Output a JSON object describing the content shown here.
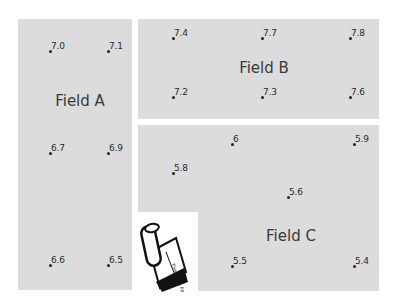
{
  "fields": [
    {
      "id": "A",
      "label": "Field A",
      "rect": [
        18,
        19,
        114,
        271
      ],
      "label_pos": [
        80,
        101
      ],
      "points": [
        {
          "value": "7.0",
          "x": 50,
          "y": 51
        },
        {
          "value": "7.1",
          "x": 108,
          "y": 51
        },
        {
          "value": "6.7",
          "x": 50,
          "y": 153
        },
        {
          "value": "6.9",
          "x": 108,
          "y": 153
        },
        {
          "value": "6.6",
          "x": 50,
          "y": 265
        },
        {
          "value": "6.5",
          "x": 108,
          "y": 265
        }
      ]
    },
    {
      "id": "B",
      "label": "Field B",
      "rect": [
        138,
        19,
        241,
        100
      ],
      "label_pos": [
        264,
        68
      ],
      "points": [
        {
          "value": "7.4",
          "x": 173,
          "y": 38
        },
        {
          "value": "7.7",
          "x": 262,
          "y": 38
        },
        {
          "value": "7.8",
          "x": 350,
          "y": 38
        },
        {
          "value": "7.2",
          "x": 173,
          "y": 97
        },
        {
          "value": "7.3",
          "x": 262,
          "y": 97
        },
        {
          "value": "7.6",
          "x": 350,
          "y": 97
        }
      ]
    },
    {
      "id": "C",
      "label": "Field C",
      "rect": [
        138,
        125,
        241,
        166
      ],
      "label_pos": [
        291,
        236
      ],
      "points": [
        {
          "value": "6",
          "x": 232,
          "y": 144
        },
        {
          "value": "5.9",
          "x": 354,
          "y": 144
        },
        {
          "value": "5.8",
          "x": 173,
          "y": 173
        },
        {
          "value": "5.6",
          "x": 288,
          "y": 197
        },
        {
          "value": "5.5",
          "x": 232,
          "y": 266
        },
        {
          "value": "5.4",
          "x": 354,
          "y": 266
        }
      ]
    }
  ],
  "logo": {
    "icon": "notebook-hand-icon",
    "text": "The Math Forum"
  }
}
